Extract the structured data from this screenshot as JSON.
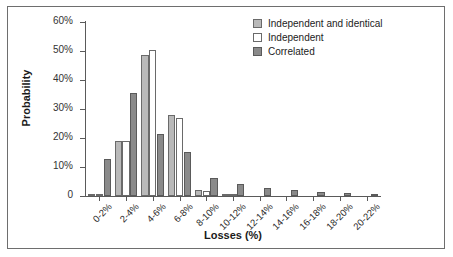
{
  "chart_data": {
    "type": "bar",
    "title": "",
    "xlabel": "Losses (%)",
    "ylabel": "Probability",
    "ylim": [
      0,
      60
    ],
    "ytick_labels": [
      "0",
      "10%",
      "20%",
      "30%",
      "40%",
      "50%",
      "60%"
    ],
    "ytick_values": [
      0,
      10,
      20,
      30,
      40,
      50,
      60
    ],
    "grid": false,
    "legend_position": "top-right",
    "categories": [
      "0-2%",
      "2-4%",
      "4-6%",
      "6-8%",
      "8-10%",
      "10-12%",
      "12-14%",
      "14-16%",
      "16-18%",
      "18-20%",
      "20-22%"
    ],
    "series": [
      {
        "name": "Independent and identical",
        "color": "#b9b9b9",
        "values": [
          0.8,
          19.0,
          48.5,
          28.0,
          2.0,
          0.6,
          0.0,
          0.0,
          0.0,
          0.0,
          0.0
        ]
      },
      {
        "name": "Independent",
        "color": "#ffffff",
        "values": [
          0.5,
          19.0,
          50.5,
          26.8,
          1.8,
          0.5,
          0.0,
          0.0,
          0.0,
          0.0,
          0.0
        ]
      },
      {
        "name": "Correlated",
        "color": "#8a8a8a",
        "values": [
          12.8,
          35.5,
          21.3,
          15.3,
          6.3,
          4.1,
          2.8,
          2.0,
          1.4,
          1.0,
          0.7
        ]
      }
    ]
  },
  "axes": {
    "y_title": "Probability",
    "x_title": "Losses (%)"
  },
  "legend": {
    "entries": [
      {
        "label": "Independent and identical",
        "swatch": "ind-ident"
      },
      {
        "label": "Independent",
        "swatch": "ind"
      },
      {
        "label": "Correlated",
        "swatch": "corr"
      }
    ]
  }
}
